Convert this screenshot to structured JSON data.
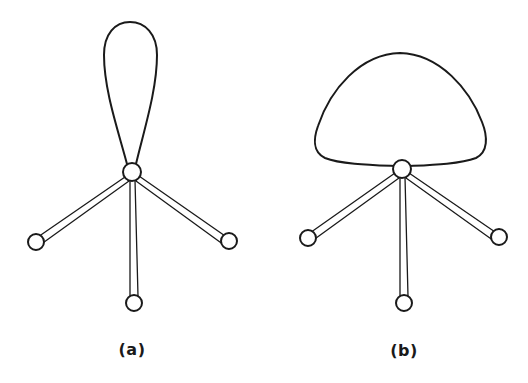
{
  "figure": {
    "panels": [
      {
        "id": "a",
        "label": "(a)",
        "description": "Tetrahedral center with narrow, elongated lone-pair lobe",
        "lobe_shape": "narrow-teardrop",
        "center_atom": {
          "x": 132,
          "y": 172,
          "r": 9
        },
        "ligands": [
          {
            "position": "left",
            "x": 36,
            "y": 242,
            "r": 8
          },
          {
            "position": "bottom",
            "x": 134,
            "y": 303,
            "r": 8
          },
          {
            "position": "right",
            "x": 229,
            "y": 241,
            "r": 8
          }
        ]
      },
      {
        "id": "b",
        "label": "(b)",
        "description": "Tetrahedral center with broad, dome-shaped lone-pair lobe",
        "lobe_shape": "broad-dome",
        "center_atom": {
          "x": 402,
          "y": 169,
          "r": 9
        },
        "ligands": [
          {
            "position": "left",
            "x": 308,
            "y": 238,
            "r": 8
          },
          {
            "position": "bottom",
            "x": 404,
            "y": 303,
            "r": 8
          },
          {
            "position": "right",
            "x": 499,
            "y": 237,
            "r": 8
          }
        ]
      }
    ],
    "colors": {
      "line": "#1a1a1a",
      "background": "#ffffff"
    }
  }
}
